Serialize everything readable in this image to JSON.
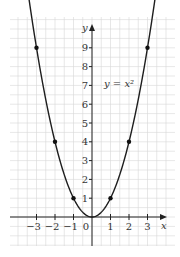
{
  "chart_data": {
    "type": "line",
    "title": "",
    "function": "y = x^2",
    "curve_label": "y = x²",
    "xlabel": "x",
    "ylabel": "y",
    "xlim": [
      -3.5,
      3.5
    ],
    "ylim": [
      -1.5,
      10
    ],
    "x_ticks": [
      -3,
      -2,
      -1,
      0,
      1,
      2,
      3
    ],
    "x_tick_labels": [
      "−3",
      "−2",
      "−1",
      "0",
      "1",
      "2",
      "3"
    ],
    "y_ticks": [
      1,
      2,
      3,
      4,
      5,
      6,
      7,
      8,
      9
    ],
    "y_tick_labels": [
      "1",
      "2",
      "3",
      "4",
      "5",
      "6",
      "7",
      "8",
      "9"
    ],
    "grid": true,
    "grid_step": 0.5,
    "marked_points": [
      {
        "x": -3,
        "y": 9
      },
      {
        "x": -2,
        "y": 4
      },
      {
        "x": -1,
        "y": 1
      },
      {
        "x": 0,
        "y": 0
      },
      {
        "x": 1,
        "y": 1
      },
      {
        "x": 2,
        "y": 4
      },
      {
        "x": 3,
        "y": 9
      }
    ],
    "curve_x_range": [
      -3.4,
      3.4
    ],
    "colors": {
      "curve": "#1e1e1e",
      "grid": "#d6d6d6",
      "axis": "#222222",
      "text": "#333333"
    }
  }
}
